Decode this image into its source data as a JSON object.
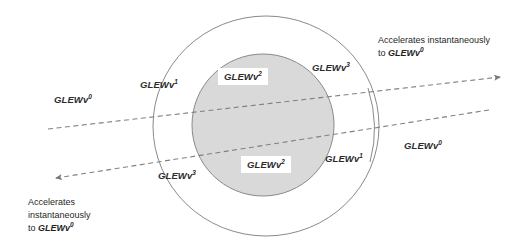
{
  "diagram": {
    "colors": {
      "inner_fill": "#d9d9d9",
      "stroke": "#7f7f7f",
      "arrow_stroke": "#808080",
      "text": "#2b2b2b",
      "background": "#ffffff"
    },
    "shapes": {
      "outer_circle": {
        "cx": 266,
        "cy": 126,
        "rx": 113,
        "ry": 110,
        "fill": "none"
      },
      "inner_circle": {
        "cx": 263,
        "cy": 125,
        "rx": 71,
        "ry": 71,
        "fill": "#d9d9d9"
      },
      "right_arc_label": "partial arc segment at right of outer circle"
    },
    "arrows": [
      {
        "name": "upper-arrow",
        "direction": "right",
        "from_x": 48,
        "from_y": 129,
        "to_x": 503,
        "to_y": 77,
        "style": "dashed",
        "head": "end"
      },
      {
        "name": "lower-arrow",
        "direction": "left",
        "from_x": 489,
        "from_y": 110,
        "to_x": 52,
        "to_y": 178,
        "style": "dashed",
        "head": "end"
      }
    ],
    "labels": [
      {
        "id": "left-outer",
        "text": "GLEWv",
        "sup": "0",
        "x": 54,
        "y": 94,
        "boxed": false
      },
      {
        "id": "upper-ring",
        "text": "GLEWv",
        "sup": "1",
        "x": 140,
        "y": 79,
        "boxed": false
      },
      {
        "id": "upper-core",
        "text": "GLEWv",
        "sup": "2",
        "x": 218,
        "y": 68,
        "boxed": true
      },
      {
        "id": "upper-inner-edge",
        "text": "GLEWv",
        "sup": "3",
        "x": 312,
        "y": 62,
        "boxed": false
      },
      {
        "id": "lower-core",
        "text": "GLEWv",
        "sup": "2",
        "x": 241,
        "y": 156,
        "boxed": true
      },
      {
        "id": "lower-inner-edge",
        "text": "GLEWv",
        "sup": "3",
        "x": 158,
        "y": 170,
        "boxed": false
      },
      {
        "id": "lower-ring",
        "text": "GLEWv",
        "sup": "1",
        "x": 325,
        "y": 153,
        "boxed": false
      },
      {
        "id": "right-outer",
        "text": "GLEWv",
        "sup": "0",
        "x": 404,
        "y": 140,
        "boxed": false
      }
    ],
    "notes": [
      {
        "id": "note-top-right",
        "x": 378,
        "y": 34,
        "lines": [
          {
            "plain": "Accelerates instantaneously",
            "em": "",
            "sup": ""
          },
          {
            "plain": "to ",
            "em": "GLEWv",
            "sup": "0"
          }
        ]
      },
      {
        "id": "note-bottom-left",
        "x": 28,
        "y": 196,
        "lines": [
          {
            "plain": "Accelerates",
            "em": "",
            "sup": ""
          },
          {
            "plain": "instantaneously",
            "em": "",
            "sup": ""
          },
          {
            "plain": "to ",
            "em": "GLEWv",
            "sup": "0"
          }
        ]
      }
    ]
  }
}
